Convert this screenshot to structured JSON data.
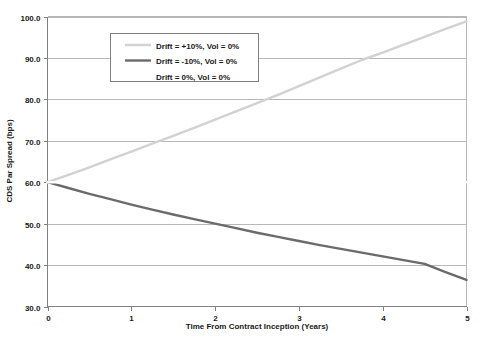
{
  "chart_data": {
    "type": "line",
    "title": "",
    "xlabel": "Time From Contract Inception (Years)",
    "ylabel": "CDS Par Spread (bps)",
    "xlim": [
      0,
      5
    ],
    "ylim": [
      30.0,
      100.0
    ],
    "xticks": [
      "0",
      "1",
      "2",
      "3",
      "4",
      "5"
    ],
    "yticks": [
      "30.0",
      "40.0",
      "50.0",
      "60.0",
      "70.0",
      "80.0",
      "90.0",
      "100.0"
    ],
    "grid": "horizontal",
    "legend_position": "top-left-inside",
    "x": [
      0,
      0.25,
      0.5,
      0.75,
      1,
      1.25,
      1.5,
      1.75,
      2,
      2.25,
      2.5,
      2.75,
      3,
      3.25,
      3.5,
      3.75,
      4,
      4.25,
      4.5,
      4.75,
      5
    ],
    "series": [
      {
        "name": "Drift = +10%, Vol = 0%",
        "color": "#d2d2d2",
        "width": 2.4,
        "values": [
          60.0,
          61.8,
          63.6,
          65.5,
          67.4,
          69.3,
          71.2,
          73.1,
          75.1,
          77.1,
          79.1,
          81.1,
          83.2,
          85.3,
          87.4,
          89.5,
          91.3,
          93.2,
          95.1,
          97.0,
          98.8
        ]
      },
      {
        "name": "Drift = -10%, Vol = 0%",
        "color": "#6b6b6b",
        "width": 2.4,
        "values": [
          60.0,
          58.6,
          57.2,
          55.9,
          54.6,
          53.4,
          52.2,
          51.1,
          50.0,
          48.9,
          47.8,
          46.8,
          45.8,
          44.8,
          43.9,
          43.0,
          42.1,
          41.2,
          40.3,
          38.3,
          36.4
        ]
      },
      {
        "name": "Drift = 0%, Vol = 0%",
        "color": "#ffffff",
        "width": 2.4,
        "values": [
          60.0,
          60.0,
          60.0,
          60.0,
          60.0,
          60.0,
          60.0,
          60.0,
          60.0,
          60.0,
          60.0,
          60.0,
          60.0,
          60.0,
          60.0,
          60.0,
          60.0,
          60.0,
          60.0,
          60.0,
          60.0
        ]
      }
    ]
  },
  "legend": {
    "items": [
      {
        "label": "Drift = +10%, Vol = 0%"
      },
      {
        "label": "Drift = -10%, Vol = 0%"
      },
      {
        "label": "Drift = 0%, Vol = 0%"
      }
    ]
  }
}
